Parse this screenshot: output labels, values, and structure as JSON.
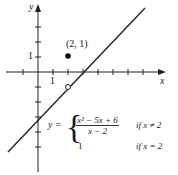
{
  "figure": {
    "axes": {
      "x_label": "x",
      "y_label": "y",
      "x_tick_label": "1",
      "y_tick_label": "1",
      "x_ticks": [
        -2,
        -1,
        1,
        2,
        3,
        4,
        5,
        6,
        7
      ],
      "y_ticks": [
        -5,
        -4,
        -3,
        -2,
        -1,
        1,
        2,
        3
      ]
    },
    "point_label": "(2, 1)",
    "filled_point": {
      "x": 2,
      "y": 1
    },
    "open_point": {
      "x": 2,
      "y": -1
    },
    "line": "y = x - 3",
    "formula": {
      "lhs": "y =",
      "case1_numerator": "x² − 5x + 6",
      "case1_denominator": "x − 2",
      "case1_condition": "if x ≠ 2",
      "case2_value": "1",
      "case2_condition": "if x = 2"
    }
  }
}
